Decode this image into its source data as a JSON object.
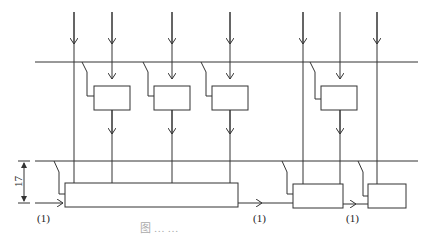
{
  "diagram": {
    "labels": {
      "input_1": "(1)",
      "input_2": "(1)",
      "input_3": "(1)",
      "dimension": "17"
    },
    "caption": "图 … …"
  }
}
